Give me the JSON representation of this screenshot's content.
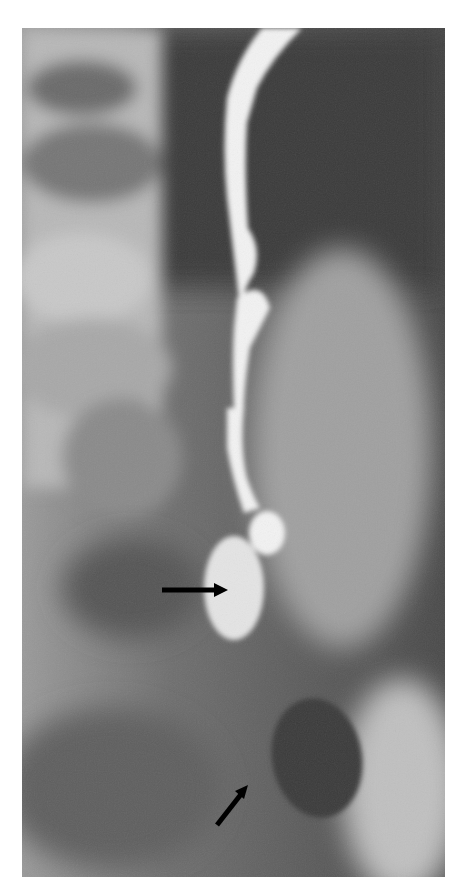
{
  "image": {
    "kind": "radiograph",
    "description": "Contrast X-ray showing a tubular opacified structure descending from top center with a bulbous distal segment",
    "annotations": [
      {
        "type": "arrow",
        "direction": "right",
        "target": "distal bulbous segment"
      },
      {
        "type": "arrow",
        "direction": "up-right",
        "target": "lower opacity near dark oval"
      }
    ]
  }
}
